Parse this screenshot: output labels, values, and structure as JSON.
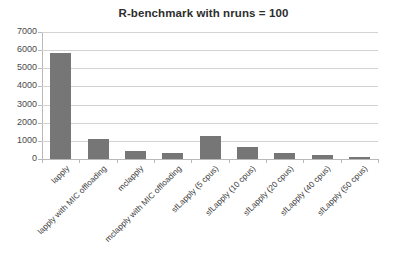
{
  "chart_data": {
    "type": "bar",
    "title": "R-benchmark with nruns = 100",
    "xlabel": "",
    "ylabel": "",
    "ylim": [
      0,
      7000
    ],
    "ytick_step": 1000,
    "yticks": [
      "7000",
      "6000",
      "5000",
      "4000",
      "3000",
      "2000",
      "1000",
      "0"
    ],
    "grid": true,
    "legend": false,
    "bar_color": "#767676",
    "gridline_color": "#d3d3d3",
    "axis_color": "#b9b9b9",
    "title_color": "#2e2e2e",
    "categories": [
      "lapply",
      "lapply with MIC offloading",
      "mclapply",
      "mclapply with MIC offloading",
      "sfLapply (5 cpus)",
      "sfLapply (10 cpus)",
      "sfLapply (20 cpus)",
      "sfLapply (40 cpus)",
      "sfLapply (50 cpus)"
    ],
    "values": [
      5850,
      1100,
      450,
      350,
      1250,
      650,
      350,
      200,
      120
    ]
  }
}
